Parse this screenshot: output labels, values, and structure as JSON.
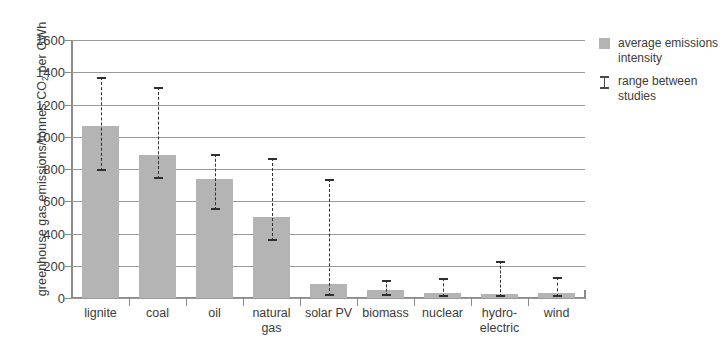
{
  "chart_data": {
    "type": "bar",
    "title": "",
    "xlabel": "",
    "ylabel": "greenhouse gas emissions/tonnes CO2 per GWh",
    "ylim": [
      0,
      1600
    ],
    "ytick_step": 200,
    "yticks": [
      1600,
      1400,
      1200,
      1000,
      800,
      600,
      400,
      200,
      0
    ],
    "grid": "horizontal",
    "legend_position": "right",
    "categories": [
      "lignite",
      "coal",
      "oil",
      "natural gas",
      "solar PV",
      "biomass",
      "nuclear",
      "hydro-electric",
      "wind"
    ],
    "category_lines": [
      [
        "lignite"
      ],
      [
        "coal"
      ],
      [
        "oil"
      ],
      [
        "natural",
        "gas"
      ],
      [
        "solar PV"
      ],
      [
        "biomass"
      ],
      [
        "nuclear"
      ],
      [
        "hydro-",
        "electric"
      ],
      [
        "wind"
      ]
    ],
    "series": [
      {
        "name": "average emissions intensity",
        "values": [
          1065,
          890,
          740,
          500,
          85,
          50,
          30,
          25,
          30
        ]
      }
    ],
    "error_ranges": {
      "name": "range between studies",
      "low": [
        790,
        740,
        545,
        355,
        10,
        10,
        5,
        5,
        5
      ],
      "high": [
        1370,
        1310,
        890,
        870,
        740,
        110,
        125,
        230,
        130
      ]
    },
    "colors": {
      "bar": "#b4b4b4",
      "error": "#2f2f2f",
      "grid": "#9a9a9a",
      "axis": "#8a8a8a",
      "text": "#3b3b3b",
      "background": "#ffffff"
    }
  },
  "axis": {
    "y_title_prefix": "greenhouse gas emissions/tonnes CO",
    "y_title_sub": "2",
    "y_title_suffix": " per GWh"
  },
  "legend": {
    "items": [
      {
        "marker": "swatch",
        "line1": "average emissions",
        "line2": "intensity"
      },
      {
        "marker": "ibeam",
        "line1": "range between",
        "line2": "studies"
      }
    ]
  }
}
